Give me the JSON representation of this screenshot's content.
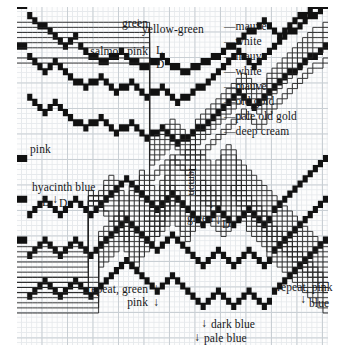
{
  "figure": {
    "type": "knitting-colour-chart",
    "grid": {
      "minor_cell_px": 5.1,
      "major_cell_px": 25.5,
      "minor_color": "#e6e9ec",
      "major_color": "#c9cfd4",
      "paper_color": "#fdfdfd"
    },
    "ink_color": "#111111"
  },
  "annotations": {
    "green_top": "green",
    "yellow_green": "yellow-green",
    "salmon_pink": "salmon pink",
    "light_top": "L",
    "dark_top": "D",
    "pink": "pink",
    "hyacinth_blue": "hyacinth blue",
    "light_mid": "L",
    "dark_mid": "D",
    "lemon": "lemon",
    "green_mid": "green",
    "dark_mid2": "D",
    "repeat_green": "repeat, green",
    "repeat_green2": "pink",
    "repeat_pink": "repeat, pink",
    "repeat_pink2": "blue",
    "dark_blue": "dark blue",
    "pale_blue": "pale blue"
  },
  "right_labels": [
    {
      "text": "—mauve"
    },
    {
      "text": "—white"
    },
    {
      "text": "—mauve"
    },
    {
      "text": "—white"
    },
    {
      "text": "—mauve"
    },
    {
      "text": "—old gold"
    },
    {
      "text": "—pale old gold"
    },
    {
      "text": "—deep cream"
    }
  ],
  "chart_data": {
    "type": "line",
    "title": "",
    "xlabel": "",
    "ylabel": "",
    "grid": true,
    "legend": "inline-annotations",
    "xlim": [
      0,
      311
    ],
    "ylim": [
      0,
      338
    ],
    "colour_names": [
      "green",
      "yellow-green",
      "salmon pink",
      "pink",
      "mauve",
      "white",
      "old gold",
      "pale old gold",
      "deep cream",
      "hyacinth blue",
      "lemon",
      "dark blue",
      "pale blue"
    ],
    "series": [
      {
        "name": "mauve-band-1",
        "style": "solid-thick",
        "values": []
      },
      {
        "name": "white-band-1",
        "style": "outline",
        "values": []
      },
      {
        "name": "mauve-band-2",
        "style": "outline",
        "values": []
      },
      {
        "name": "white-band-2",
        "style": "outline",
        "values": []
      },
      {
        "name": "mauve-band-3",
        "style": "solid-thick",
        "values": []
      },
      {
        "name": "old-gold",
        "style": "outline",
        "values": []
      },
      {
        "name": "pale-old-gold",
        "style": "outline",
        "values": []
      },
      {
        "name": "deep-cream",
        "style": "outline",
        "values": []
      },
      {
        "name": "pink",
        "style": "solid-thick",
        "values": []
      },
      {
        "name": "hyacinth-blue",
        "style": "solid-thick",
        "values": []
      },
      {
        "name": "lemon",
        "style": "outline",
        "values": []
      },
      {
        "name": "dark-blue",
        "style": "solid-thick",
        "values": []
      },
      {
        "name": "pale-blue",
        "style": "solid-thick",
        "values": []
      }
    ]
  }
}
